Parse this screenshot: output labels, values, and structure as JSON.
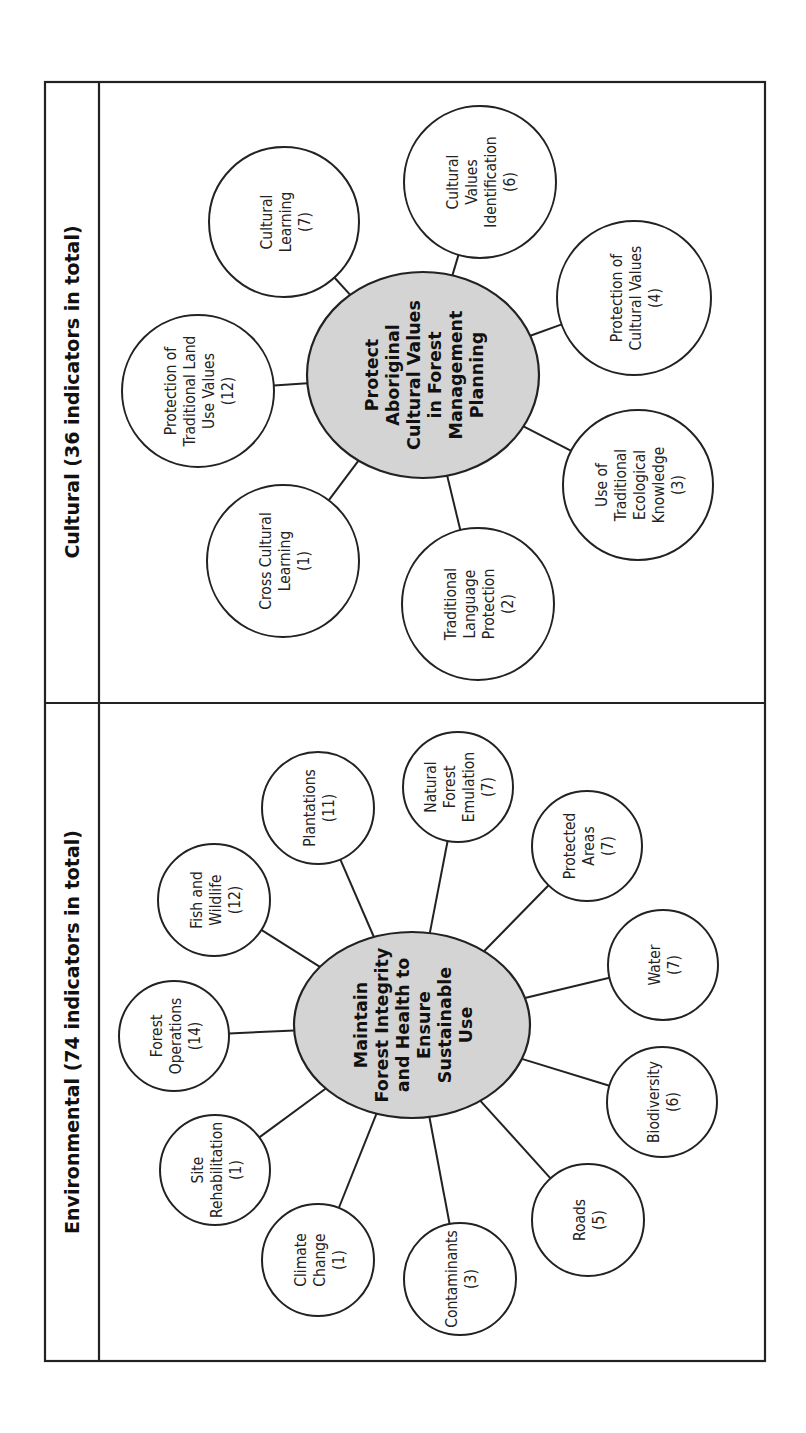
{
  "frame": {
    "x": 45,
    "y": 82,
    "width": 720,
    "height": 1279,
    "title_band_right_x": 99,
    "section_divider_y": 703
  },
  "colors": {
    "hub_fill": "#d4d4d4",
    "stroke": "#222222",
    "node_fill": "#ffffff"
  },
  "sections": [
    {
      "id": "cultural",
      "title": "Cultural (36 indicators in total)",
      "title_pos": {
        "x": 72,
        "y": 392
      },
      "total_indicators": 36,
      "hub": {
        "label_lines": [
          "Protect",
          "Aboriginal",
          "Cultural Values",
          "in Forest",
          "Management",
          "Planning"
        ],
        "cx": 423,
        "cy": 375,
        "rx": 116,
        "ry": 103
      },
      "nodes": [
        {
          "label_lines": [
            "Protection of",
            "Traditional Land",
            "Use Values",
            "(12)"
          ],
          "name": "Protection of Traditional Land Use Values",
          "count": 12,
          "cx": 198,
          "cy": 391,
          "r": 76
        },
        {
          "label_lines": [
            "Cultural",
            "Learning",
            "(7)"
          ],
          "name": "Cultural Learning",
          "count": 7,
          "cx": 284,
          "cy": 222,
          "r": 75
        },
        {
          "label_lines": [
            "Cultural",
            "Values",
            "Identification",
            "(6)"
          ],
          "name": "Cultural Values Identification",
          "count": 6,
          "cx": 480,
          "cy": 182,
          "r": 76
        },
        {
          "label_lines": [
            "Protection of",
            "Cultural Values",
            "(4)"
          ],
          "name": "Protection of Cultural Values",
          "count": 4,
          "cx": 634,
          "cy": 298,
          "r": 77
        },
        {
          "label_lines": [
            "Use of",
            "Traditional",
            "Ecological",
            "Knowledge",
            "(3)"
          ],
          "name": "Use of Traditional Ecological Knowledge",
          "count": 3,
          "cx": 638,
          "cy": 485,
          "r": 75
        },
        {
          "label_lines": [
            "Traditional",
            "Language",
            "Protection",
            "(2)"
          ],
          "name": "Traditional Language Protection",
          "count": 2,
          "cx": 478,
          "cy": 604,
          "r": 76
        },
        {
          "label_lines": [
            "Cross Cultural",
            "Learning",
            "(1)"
          ],
          "name": "Cross Cultural Learning",
          "count": 1,
          "cx": 283,
          "cy": 561,
          "r": 76
        }
      ]
    },
    {
      "id": "environmental",
      "title": "Environmental (74 indicators in total)",
      "title_pos": {
        "x": 72,
        "y": 1032
      },
      "total_indicators": 74,
      "hub": {
        "label_lines": [
          "Maintain",
          "Forest Integrity",
          "and Health to",
          "Ensure",
          "Sustainable",
          "Use"
        ],
        "cx": 412,
        "cy": 1025,
        "rx": 118,
        "ry": 93
      },
      "nodes": [
        {
          "label_lines": [
            "Forest",
            "Operations",
            "(14)"
          ],
          "name": "Forest Operations",
          "count": 14,
          "cx": 174,
          "cy": 1036,
          "r": 55
        },
        {
          "label_lines": [
            "Fish and",
            "Wildlife",
            "(12)"
          ],
          "name": "Fish and Wildlife",
          "count": 12,
          "cx": 214,
          "cy": 900,
          "r": 56
        },
        {
          "label_lines": [
            "Plantations",
            "(11)"
          ],
          "name": "Plantations",
          "count": 11,
          "cx": 318,
          "cy": 808,
          "r": 56
        },
        {
          "label_lines": [
            "Natural",
            "Forest",
            "Emulation",
            "(7)"
          ],
          "name": "Natural Forest Emulation",
          "count": 7,
          "cx": 458,
          "cy": 787,
          "r": 55
        },
        {
          "label_lines": [
            "Protected",
            "Areas",
            "(7)"
          ],
          "name": "Protected Areas",
          "count": 7,
          "cx": 587,
          "cy": 846,
          "r": 55
        },
        {
          "label_lines": [
            "Water",
            "(7)"
          ],
          "name": "Water",
          "count": 7,
          "cx": 663,
          "cy": 965,
          "r": 55
        },
        {
          "label_lines": [
            "Biodiversity",
            "(6)"
          ],
          "name": "Biodiversity",
          "count": 6,
          "cx": 662,
          "cy": 1102,
          "r": 55
        },
        {
          "label_lines": [
            "Roads",
            "(5)"
          ],
          "name": "Roads",
          "count": 5,
          "cx": 588,
          "cy": 1220,
          "r": 56
        },
        {
          "label_lines": [
            "Contaminants",
            "(3)"
          ],
          "name": "Contaminants",
          "count": 3,
          "cx": 460,
          "cy": 1279,
          "r": 56
        },
        {
          "label_lines": [
            "Climate",
            "Change",
            "(1)"
          ],
          "name": "Climate Change",
          "count": 1,
          "cx": 318,
          "cy": 1260,
          "r": 56
        },
        {
          "label_lines": [
            "Site",
            "Rehabilitation",
            "(1)"
          ],
          "name": "Site Rehabilitation",
          "count": 1,
          "cx": 215,
          "cy": 1170,
          "r": 55
        }
      ]
    }
  ]
}
